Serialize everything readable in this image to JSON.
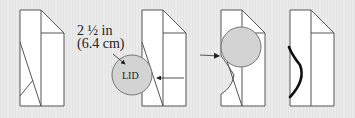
{
  "diagram": {
    "measurement": {
      "line1": "2 ½ in",
      "line2": "(6.4 cm)"
    },
    "circle_label": "LID",
    "colors": {
      "background": "#e9e9e9",
      "paper": "#ffffff",
      "outline": "#555555",
      "circle_fill": "#d3d3d3",
      "circle_stroke": "#777777",
      "cut_line": "#111111"
    },
    "panels": [
      {
        "id": 1,
        "description": "folded paper with diagonal crease"
      },
      {
        "id": 2,
        "description": "lid circle traced against paper edge"
      },
      {
        "id": 3,
        "description": "circle placed at upper-left with cut curve below"
      },
      {
        "id": 4,
        "description": "resulting curved cut edge"
      }
    ]
  }
}
